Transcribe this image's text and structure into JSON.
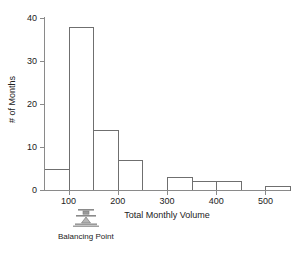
{
  "chart_data": {
    "type": "bar",
    "title": "",
    "subtitle": "",
    "xlabel": "Total Monthly Volume",
    "ylabel": "# of Months",
    "xlim": [
      50,
      550
    ],
    "ylim": [
      0,
      40
    ],
    "xticks": [
      100,
      200,
      300,
      400,
      500
    ],
    "yticks": [
      0,
      10,
      20,
      30,
      40
    ],
    "grid": false,
    "legend": null,
    "bin_width": 50,
    "bin_edges": [
      50,
      100,
      150,
      200,
      250,
      300,
      350,
      400,
      450,
      500,
      550
    ],
    "categories": [
      "50-100",
      "100-150",
      "150-200",
      "200-250",
      "250-300",
      "300-350",
      "350-400",
      "400-450",
      "450-500",
      "500-550"
    ],
    "values": [
      5,
      38,
      14,
      7,
      0,
      3,
      2,
      2,
      0,
      1
    ],
    "annotations": [
      {
        "name": "balancing-point",
        "label": "Balancing Point",
        "x_value": 135,
        "shaded_range": [
          50,
          140
        ]
      }
    ],
    "colors": {
      "bar_fill": "#ffffff",
      "bar_edge": "#6f6f6f",
      "shaded_band": "#c9c9c9",
      "axis": "#8a8a8a",
      "text": "#222222"
    }
  },
  "axes": {
    "y_tick_labels": [
      "0",
      "10",
      "20",
      "30",
      "40"
    ],
    "x_tick_labels": [
      "100",
      "200",
      "300",
      "400",
      "500"
    ],
    "y_title": "# of Months",
    "x_title": "Total Monthly Volume"
  },
  "marker": {
    "label": "Balancing Point"
  }
}
